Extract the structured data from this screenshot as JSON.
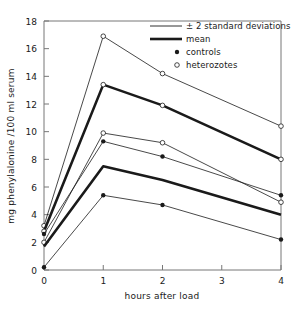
{
  "chart_data": {
    "type": "line",
    "title": "",
    "xlabel": "hours after load",
    "ylabel": "mg phenylalonine /100 ml serum",
    "xlim": [
      0,
      4
    ],
    "ylim": [
      0,
      18
    ],
    "xticks": [
      0,
      1,
      2,
      3,
      4
    ],
    "yticks": [
      0,
      2,
      4,
      6,
      8,
      10,
      12,
      14,
      16,
      18
    ],
    "xtick_labels": [
      "0",
      "1",
      "2",
      "3",
      "4"
    ],
    "ytick_labels": [
      "0",
      "2",
      "4",
      "6",
      "8",
      "10",
      "12",
      "14",
      "16",
      "18"
    ],
    "grid": false,
    "legend_position": "top-right",
    "x": [
      0,
      1,
      2,
      4
    ],
    "series": [
      {
        "name": "heterozygotes +2 SD",
        "group": "heterozotes",
        "style": "thin",
        "marker": "open-circle",
        "values": [
          3.2,
          16.9,
          14.2,
          10.4
        ]
      },
      {
        "name": "heterozygotes mean",
        "group": "heterozotes",
        "style": "thick",
        "marker": "open-circle",
        "values": [
          2.8,
          13.4,
          11.9,
          8.0
        ]
      },
      {
        "name": "heterozygotes -2 SD",
        "group": "heterozotes",
        "style": "thin",
        "marker": "open-circle",
        "values": [
          2.0,
          9.9,
          9.2,
          4.9
        ]
      },
      {
        "name": "controls +2 SD",
        "group": "controls",
        "style": "thin",
        "marker": "filled-dot",
        "values": [
          2.6,
          9.3,
          8.2,
          5.4
        ]
      },
      {
        "name": "controls mean",
        "group": "controls",
        "style": "thick",
        "marker": "none",
        "values": [
          1.7,
          7.5,
          6.5,
          4.0
        ]
      },
      {
        "name": "controls -2 SD",
        "group": "controls",
        "style": "thin",
        "marker": "filled-dot",
        "values": [
          0.2,
          5.4,
          4.7,
          2.2
        ]
      }
    ]
  },
  "legend": {
    "items": [
      {
        "label": "± 2 standard deviations",
        "marker": "thin-line"
      },
      {
        "label": "mean",
        "marker": "thick-line"
      },
      {
        "label": "controls",
        "marker": "filled-dot"
      },
      {
        "label": "heterozotes",
        "marker": "open-circle"
      }
    ]
  },
  "colors": {
    "line": "#1a1a1a",
    "axis": "#555555",
    "background": "#ffffff"
  }
}
